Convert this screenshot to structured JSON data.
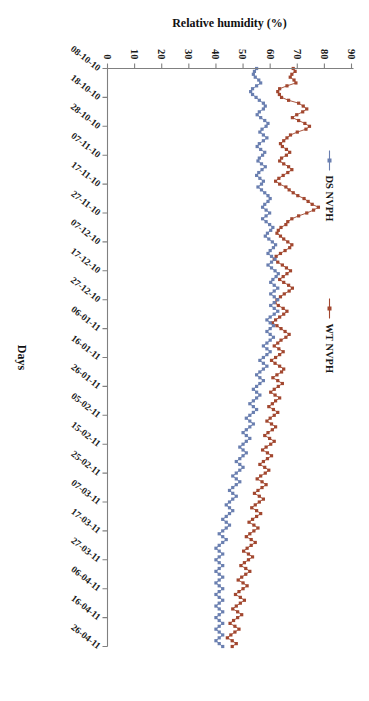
{
  "chart_data": {
    "type": "line",
    "title": "",
    "xlabel": "Days",
    "ylabel": "Relative humidity (%)",
    "ylim": [
      0,
      90
    ],
    "ytick_values": [
      0,
      10,
      20,
      30,
      40,
      50,
      60,
      70,
      80,
      90
    ],
    "ytick_labels": [
      "0",
      "10",
      "20",
      "30",
      "40",
      "50",
      "60",
      "70",
      "80",
      "90"
    ],
    "grid": false,
    "legend_position": "upper-left",
    "xtick_labels": [
      "08-10-10",
      "18-10-10",
      "28-10-10",
      "07-11-10",
      "17-11-10",
      "27-11-10",
      "07-12-10",
      "17-12-10",
      "27-12-10",
      "06-01-11",
      "16-01-11",
      "26-01-11",
      "05-02-11",
      "15-02-11",
      "25-02-11",
      "07-03-11",
      "17-03-11",
      "27-03-11",
      "06-04-11",
      "16-04-11",
      "26-04-11"
    ],
    "xtick_interval_days": 10,
    "n_points": 201,
    "series": [
      {
        "name": "WT NVPH",
        "color": "#a2472f",
        "marker": "square",
        "values": [
          68.5,
          69.2,
          68.0,
          67.4,
          68.8,
          69.5,
          66.2,
          63.5,
          62.8,
          63.4,
          64.2,
          66.8,
          70.5,
          72.2,
          73.5,
          72.0,
          69.8,
          68.2,
          70.5,
          72.8,
          74.5,
          73.2,
          70.0,
          67.5,
          66.2,
          65.0,
          63.8,
          64.5,
          66.0,
          67.2,
          66.0,
          64.2,
          63.5,
          65.0,
          66.8,
          68.0,
          66.5,
          64.8,
          63.2,
          62.0,
          63.5,
          65.8,
          67.0,
          68.5,
          70.2,
          72.5,
          74.0,
          75.5,
          77.8,
          76.0,
          73.5,
          70.5,
          68.0,
          66.5,
          65.8,
          64.0,
          63.0,
          62.5,
          63.8,
          65.0,
          66.5,
          68.0,
          67.2,
          65.5,
          63.8,
          62.2,
          61.5,
          62.8,
          64.5,
          66.0,
          67.5,
          66.2,
          64.8,
          63.5,
          65.0,
          66.8,
          68.2,
          67.0,
          65.2,
          63.8,
          62.5,
          61.8,
          63.0,
          64.8,
          66.2,
          65.0,
          63.5,
          62.0,
          60.8,
          62.5,
          64.0,
          65.5,
          67.0,
          65.8,
          64.0,
          62.8,
          61.5,
          63.2,
          64.8,
          63.5,
          62.0,
          60.5,
          61.8,
          63.5,
          65.0,
          64.2,
          62.5,
          61.0,
          62.8,
          64.5,
          63.0,
          61.5,
          60.2,
          61.8,
          63.5,
          62.0,
          60.8,
          59.5,
          61.2,
          62.8,
          61.5,
          60.0,
          58.8,
          60.5,
          62.0,
          60.8,
          59.2,
          58.0,
          59.8,
          61.5,
          60.2,
          58.5,
          57.2,
          59.0,
          60.5,
          59.0,
          57.5,
          56.2,
          58.0,
          59.5,
          58.2,
          56.5,
          55.2,
          57.0,
          58.5,
          57.0,
          55.5,
          54.2,
          56.0,
          57.5,
          56.0,
          54.5,
          53.2,
          55.0,
          56.5,
          55.0,
          53.5,
          52.2,
          54.0,
          55.5,
          54.0,
          52.5,
          51.2,
          53.0,
          54.5,
          53.0,
          51.5,
          50.2,
          52.0,
          53.5,
          52.0,
          50.5,
          49.2,
          51.0,
          52.5,
          51.0,
          49.5,
          48.2,
          50.0,
          51.5,
          50.0,
          48.5,
          47.2,
          49.0,
          50.5,
          49.0,
          47.5,
          46.2,
          48.0,
          49.5,
          48.0,
          46.5,
          45.2,
          47.0,
          48.5,
          47.0,
          45.5,
          44.2,
          46.0,
          47.5,
          46.0
        ]
      },
      {
        "name": "DS NVPH",
        "color": "#6a7fb0",
        "marker": "square",
        "values": [
          55.0,
          54.2,
          53.8,
          54.5,
          55.8,
          56.5,
          55.0,
          53.5,
          52.8,
          53.5,
          54.8,
          56.0,
          57.5,
          58.2,
          57.5,
          56.0,
          55.2,
          56.5,
          58.0,
          59.2,
          58.5,
          57.0,
          56.2,
          57.5,
          58.8,
          57.5,
          56.0,
          55.2,
          56.5,
          58.0,
          57.2,
          56.0,
          55.5,
          56.8,
          58.2,
          57.0,
          55.8,
          55.0,
          56.2,
          57.5,
          56.8,
          55.5,
          56.8,
          58.0,
          59.2,
          60.0,
          59.2,
          58.0,
          57.2,
          58.5,
          59.8,
          58.5,
          57.2,
          58.5,
          59.8,
          61.0,
          60.2,
          59.0,
          58.2,
          59.5,
          60.8,
          62.0,
          61.2,
          60.0,
          59.2,
          60.5,
          61.8,
          60.5,
          59.2,
          60.5,
          61.8,
          63.0,
          62.2,
          61.0,
          60.2,
          61.5,
          62.8,
          61.5,
          60.2,
          61.5,
          62.8,
          61.5,
          60.2,
          61.5,
          62.8,
          61.5,
          60.0,
          58.8,
          60.0,
          61.2,
          60.0,
          58.8,
          60.0,
          61.2,
          60.0,
          58.8,
          57.5,
          58.8,
          60.0,
          58.8,
          57.5,
          56.2,
          57.5,
          58.8,
          57.5,
          56.2,
          55.0,
          56.2,
          57.5,
          56.2,
          55.0,
          53.8,
          55.0,
          56.2,
          55.0,
          53.8,
          52.5,
          53.8,
          55.0,
          53.8,
          52.5,
          51.2,
          52.5,
          53.8,
          52.5,
          51.2,
          50.0,
          51.2,
          52.5,
          51.2,
          50.0,
          48.8,
          50.0,
          51.2,
          50.0,
          48.8,
          47.5,
          48.8,
          50.0,
          48.8,
          47.5,
          46.2,
          47.5,
          48.8,
          47.5,
          46.2,
          45.0,
          46.2,
          47.5,
          46.2,
          45.0,
          43.8,
          45.0,
          46.2,
          45.0,
          43.8,
          42.5,
          43.8,
          45.0,
          43.8,
          42.5,
          41.2,
          42.5,
          43.8,
          42.5,
          41.2,
          40.0,
          41.2,
          42.5,
          41.2,
          40.0,
          41.2,
          42.5,
          41.2,
          40.0,
          41.2,
          42.5,
          41.2,
          40.0,
          41.2,
          42.5,
          41.2,
          40.0,
          41.2,
          42.5,
          41.2,
          40.0,
          41.2,
          42.5,
          41.2,
          40.0,
          41.2,
          42.5,
          41.2,
          40.0,
          41.2,
          42.5,
          41.2,
          40.0,
          41.2,
          42.5
        ]
      }
    ]
  }
}
